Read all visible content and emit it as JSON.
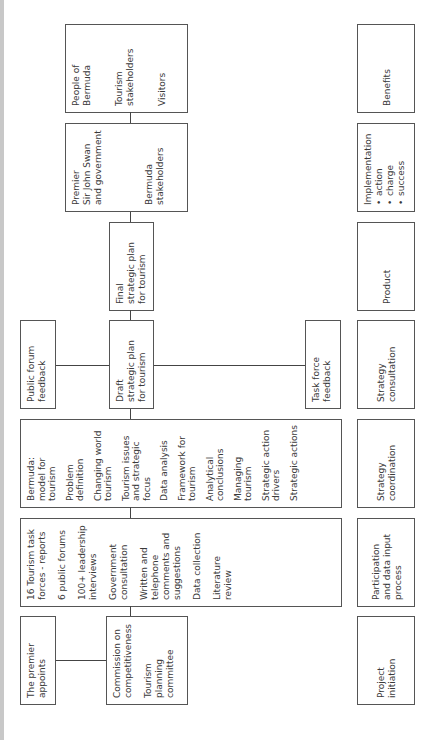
{
  "diagram": {
    "orientation": "rotated 90 degrees counter-clockwise",
    "stages": [
      {
        "id": "project-initiation",
        "label": "Project\ninitiation"
      },
      {
        "id": "participation",
        "label": "Participation\nand data input\nprocess"
      },
      {
        "id": "strategy-coordination",
        "label": "Strategy\ncoordination"
      },
      {
        "id": "strategy-consultation",
        "label": "Strategy\nconsultation"
      },
      {
        "id": "product",
        "label": "Product"
      },
      {
        "id": "implementation",
        "label": "Implementation",
        "bullets": [
          "action",
          "charge",
          "success"
        ]
      },
      {
        "id": "benefits",
        "label": "Benefits"
      }
    ],
    "boxes": {
      "premier_appoints": {
        "text": "The premier\nappoints"
      },
      "commission": {
        "items": [
          "Commission on\ncompetitiveness",
          "Tourism\nplanning\ncommittee"
        ]
      },
      "participation_inputs": {
        "items": [
          "16 Tourism task\nforces - reports",
          "6 public forums",
          "100+ leadership\ninterviews",
          "Government\nconsultation",
          "Written and\ntelephone\ncomments and\nsuggestions",
          "Data collection",
          "Literature\nreview"
        ]
      },
      "bermuda_model": {
        "items": [
          "Bermuda:\nmodel for tourism",
          "Problem definition",
          "Changing world\ntourism",
          "Tourism issues\nand strategic\nfocus",
          "Data analysis",
          "Framework for\ntourism",
          "Analytical\nconclusions",
          "Managing\ntourism",
          "Strategic action\ndrivers",
          "Strategic actions"
        ]
      },
      "public_forum_feedback": {
        "text": "Public forum\nfeedback"
      },
      "draft_plan": {
        "text": "Draft\nstrategic plan\nfor tourism"
      },
      "task_force_feedback": {
        "text": "Task force\nfeedback"
      },
      "final_plan": {
        "text": "Final\nstrategic plan\nfor tourism"
      },
      "premier_government": {
        "items": [
          "Premier\nSir John Swan\nand government",
          "Bermuda\nstakeholders"
        ]
      },
      "people": {
        "items": [
          "People of\nBermuda",
          "Tourism\nstakeholders",
          "Visitors"
        ]
      }
    }
  }
}
